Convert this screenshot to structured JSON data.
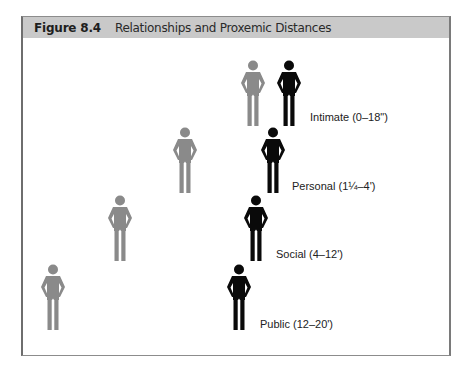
{
  "figure": {
    "number": "Figure 8.4",
    "title": "Relationships and Proxemic Distances"
  },
  "colors": {
    "header_bg": "#c9c9c9",
    "gray_person": "#8a8a8a",
    "black_person": "#0a0a0a",
    "frame": "#8c8c8c"
  },
  "zones": [
    {
      "name": "Intimate",
      "label": "Intimate (0–18\")",
      "gray_person": {
        "x": 240,
        "y": 60
      },
      "black_person": {
        "x": 276,
        "y": 60
      },
      "label_pos": {
        "x": 310,
        "y": 111
      }
    },
    {
      "name": "Personal",
      "label": "Personal (1¼–4')",
      "gray_person": {
        "x": 172,
        "y": 127
      },
      "black_person": {
        "x": 260,
        "y": 127
      },
      "label_pos": {
        "x": 292,
        "y": 180
      }
    },
    {
      "name": "Social",
      "label": "Social (4–12')",
      "gray_person": {
        "x": 107,
        "y": 195
      },
      "black_person": {
        "x": 243,
        "y": 195
      },
      "label_pos": {
        "x": 276,
        "y": 248
      }
    },
    {
      "name": "Public",
      "label": "Public (12–20')",
      "gray_person": {
        "x": 40,
        "y": 264
      },
      "black_person": {
        "x": 226,
        "y": 264
      },
      "label_pos": {
        "x": 260,
        "y": 318
      }
    }
  ]
}
